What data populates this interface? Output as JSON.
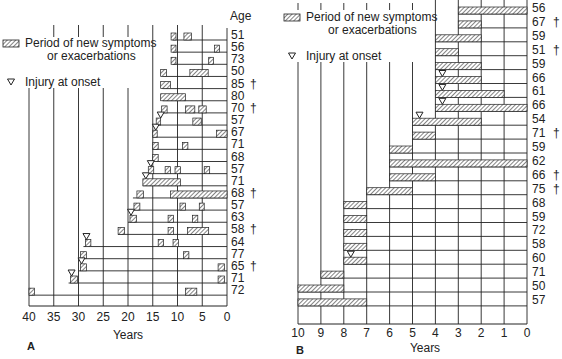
{
  "legend": {
    "symptoms_label_line1": "Period of new symptoms",
    "symptoms_label_line2": "or exacerbations",
    "injury_label": "Injury at onset"
  },
  "chart_data": [
    {
      "panel": "A",
      "type": "timeline",
      "xlabel": "Years",
      "ylabel": "Age",
      "xlim": [
        40,
        0
      ],
      "x_ticks": [
        40,
        35,
        30,
        25,
        20,
        15,
        10,
        5,
        0
      ],
      "grid": true,
      "legend_position": "top-left",
      "rows": [
        {
          "age": "51",
          "dagger": false,
          "start": 11,
          "injury": false,
          "periods": [
            [
              11.3,
              10.3
            ],
            [
              8.7,
              7.2
            ]
          ]
        },
        {
          "age": "56",
          "dagger": false,
          "start": 11,
          "injury": false,
          "periods": [
            [
              11.3,
              10.3
            ],
            [
              2.5,
              1.5
            ]
          ]
        },
        {
          "age": "73",
          "dagger": false,
          "start": 11,
          "injury": false,
          "periods": [
            [
              11.3,
              10.3
            ],
            [
              3.7,
              2.7
            ]
          ]
        },
        {
          "age": "50",
          "dagger": false,
          "start": 13,
          "injury": false,
          "periods": [
            [
              13.4,
              12.2
            ],
            [
              7.5,
              3.8
            ]
          ]
        },
        {
          "age": "85",
          "dagger": true,
          "start": 13,
          "injury": false,
          "periods": [
            [
              13.4,
              11.4
            ]
          ]
        },
        {
          "age": "80",
          "dagger": false,
          "start": 13,
          "injury": false,
          "periods": [
            [
              13.4,
              8.4
            ]
          ]
        },
        {
          "age": "70",
          "dagger": true,
          "start": 13,
          "injury": false,
          "periods": [
            [
              13.2,
              12.1
            ],
            [
              8.4,
              6.5
            ],
            [
              5.7,
              4.2
            ]
          ]
        },
        {
          "age": "57",
          "dagger": false,
          "start": 14,
          "injury": true,
          "periods": [
            [
              14.3,
              13.4
            ],
            [
              6.9,
              5.2
            ]
          ]
        },
        {
          "age": "67",
          "dagger": false,
          "start": 15,
          "injury": true,
          "periods": [
            [
              15.0,
              14.1
            ],
            [
              2.1,
              0
            ]
          ]
        },
        {
          "age": "71",
          "dagger": false,
          "start": 15,
          "injury": false,
          "periods": [
            [
              15.0,
              13.9
            ],
            [
              9.0,
              7.9
            ]
          ]
        },
        {
          "age": "68",
          "dagger": false,
          "start": 15,
          "injury": false,
          "periods": [
            [
              15.0,
              13.9
            ]
          ]
        },
        {
          "age": "57",
          "dagger": false,
          "start": 16,
          "injury": true,
          "periods": [
            [
              15.9,
              14.8
            ],
            [
              12.5,
              11.4
            ],
            [
              10.5,
              9.4
            ],
            [
              4.6,
              3.5
            ]
          ]
        },
        {
          "age": "71",
          "dagger": false,
          "start": 17,
          "injury": true,
          "periods": [
            [
              17.0,
              9.4
            ]
          ]
        },
        {
          "age": "68",
          "dagger": true,
          "start": 19,
          "injury": false,
          "periods": [
            [
              18.2,
              16.9
            ],
            [
              11.4,
              0
            ]
          ]
        },
        {
          "age": "57",
          "dagger": false,
          "start": 19,
          "injury": false,
          "periods": [
            [
              18.8,
              17.6
            ],
            [
              9.5,
              8.4
            ],
            [
              5.6,
              4.6
            ]
          ]
        },
        {
          "age": "63",
          "dagger": false,
          "start": 20,
          "injury": true,
          "periods": [
            [
              19.6,
              18.3
            ],
            [
              11.9,
              10.8
            ],
            [
              7.0,
              5.9
            ]
          ]
        },
        {
          "age": "58",
          "dagger": true,
          "start": 22,
          "injury": false,
          "periods": [
            [
              22.0,
              20.7
            ],
            [
              11.9,
              10.8
            ],
            [
              8.0,
              3.7
            ]
          ]
        },
        {
          "age": "64",
          "dagger": false,
          "start": 29,
          "injury": true,
          "periods": [
            [
              28.6,
              27.5
            ],
            [
              13.9,
              12.8
            ],
            [
              10.9,
              9.8
            ]
          ]
        },
        {
          "age": "77",
          "dagger": false,
          "start": 30,
          "injury": false,
          "periods": [
            [
              29.6,
              28.4
            ],
            [
              8.8,
              7.7
            ]
          ]
        },
        {
          "age": "65",
          "dagger": true,
          "start": 30,
          "injury": true,
          "periods": [
            [
              29.6,
              28.4
            ],
            [
              1.8,
              0.5
            ]
          ]
        },
        {
          "age": "71",
          "dagger": false,
          "start": 32,
          "injury": true,
          "periods": [
            [
              31.6,
              30.2
            ],
            [
              1.8,
              0.5
            ]
          ]
        },
        {
          "age": "72",
          "dagger": false,
          "start": 40,
          "injury": false,
          "periods": [
            [
              40.0,
              38.9
            ],
            [
              8.4,
              6.1
            ]
          ]
        }
      ]
    },
    {
      "panel": "B",
      "type": "timeline",
      "xlabel": "Years",
      "ylabel": "",
      "xlim": [
        10,
        0
      ],
      "x_ticks": [
        10,
        9,
        8,
        7,
        6,
        5,
        4,
        3,
        2,
        1,
        0
      ],
      "grid": true,
      "legend_position": "top-left",
      "rows": [
        {
          "age": "56",
          "dagger": false,
          "start": 3,
          "injury": false,
          "periods": [
            [
              3,
              0
            ]
          ]
        },
        {
          "age": "67",
          "dagger": true,
          "start": 3,
          "injury": false,
          "periods": [
            [
              3,
              2
            ]
          ]
        },
        {
          "age": "59",
          "dagger": false,
          "start": 4,
          "injury": false,
          "periods": [
            [
              4,
              2
            ]
          ]
        },
        {
          "age": "51",
          "dagger": true,
          "start": 4,
          "injury": false,
          "periods": [
            [
              4,
              3
            ]
          ]
        },
        {
          "age": "59",
          "dagger": false,
          "start": 4,
          "injury": false,
          "periods": [
            [
              4,
              2
            ]
          ]
        },
        {
          "age": "66",
          "dagger": false,
          "start": 4,
          "injury": true,
          "periods": [
            [
              4,
              2
            ]
          ]
        },
        {
          "age": "61",
          "dagger": false,
          "start": 4,
          "injury": true,
          "periods": [
            [
              4,
              1
            ]
          ]
        },
        {
          "age": "66",
          "dagger": false,
          "start": 4,
          "injury": true,
          "periods": [
            [
              4,
              0
            ]
          ]
        },
        {
          "age": "54",
          "dagger": false,
          "start": 5,
          "injury": true,
          "periods": [
            [
              5,
              2
            ]
          ]
        },
        {
          "age": "71",
          "dagger": true,
          "start": 5,
          "injury": false,
          "periods": [
            [
              5,
              4
            ]
          ]
        },
        {
          "age": "59",
          "dagger": false,
          "start": 6,
          "injury": false,
          "periods": [
            [
              6,
              5
            ]
          ]
        },
        {
          "age": "62",
          "dagger": false,
          "start": 6,
          "injury": false,
          "periods": [
            [
              6,
              0
            ]
          ]
        },
        {
          "age": "66",
          "dagger": true,
          "start": 6,
          "injury": false,
          "periods": [
            [
              6,
              4
            ]
          ]
        },
        {
          "age": "75",
          "dagger": true,
          "start": 7,
          "injury": false,
          "periods": [
            [
              7,
              5
            ]
          ]
        },
        {
          "age": "68",
          "dagger": false,
          "start": 8,
          "injury": false,
          "periods": [
            [
              8,
              7
            ]
          ]
        },
        {
          "age": "59",
          "dagger": false,
          "start": 8,
          "injury": false,
          "periods": [
            [
              8,
              7
            ]
          ]
        },
        {
          "age": "72",
          "dagger": false,
          "start": 8,
          "injury": false,
          "periods": [
            [
              8,
              7
            ]
          ]
        },
        {
          "age": "58",
          "dagger": false,
          "start": 8,
          "injury": false,
          "periods": [
            [
              8,
              7
            ]
          ]
        },
        {
          "age": "60",
          "dagger": false,
          "start": 8,
          "injury": true,
          "periods": [
            [
              8,
              7
            ]
          ]
        },
        {
          "age": "71",
          "dagger": false,
          "start": 9,
          "injury": false,
          "periods": [
            [
              9,
              8
            ]
          ]
        },
        {
          "age": "50",
          "dagger": false,
          "start": 10,
          "injury": false,
          "periods": [
            [
              10,
              8
            ]
          ]
        },
        {
          "age": "57",
          "dagger": false,
          "start": 10,
          "injury": false,
          "periods": [
            [
              10,
              7
            ]
          ]
        }
      ]
    }
  ],
  "panels": {
    "A": {
      "letter": "A",
      "xlabel": "Years",
      "age_header": "Age"
    },
    "B": {
      "letter": "B",
      "xlabel": "Years"
    }
  },
  "dagger_symbol": "†"
}
